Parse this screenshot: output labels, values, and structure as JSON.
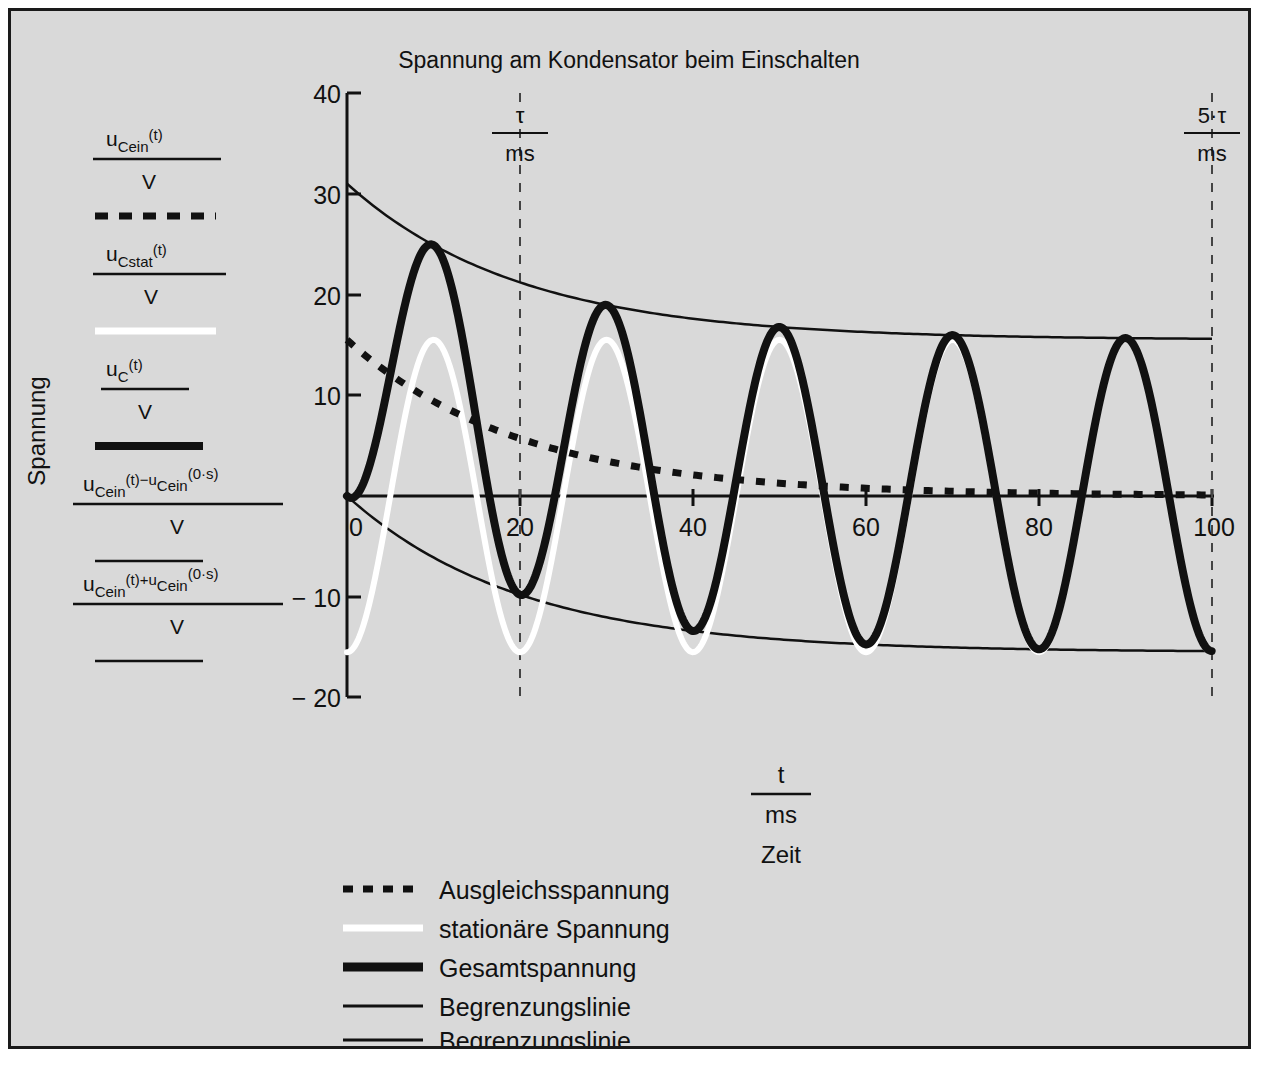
{
  "chart_data": {
    "type": "line",
    "title": "Spannung am Kondensator beim Einschalten",
    "xlabel_fraction": {
      "num": "t",
      "den": "ms"
    },
    "xlabel_text": "Zeit",
    "ylabel_text": "Spannung",
    "xlim": [
      0,
      100
    ],
    "ylim": [
      -20,
      40
    ],
    "xticks": [
      "0",
      "20",
      "40",
      "60",
      "80",
      "100"
    ],
    "xtick_values": [
      0,
      20,
      40,
      60,
      80,
      100
    ],
    "yticks": [
      "40",
      "30",
      "20",
      "10",
      "− 10",
      "− 20"
    ],
    "ytick_values": [
      40,
      30,
      20,
      10,
      -10,
      -20
    ],
    "grid": false,
    "legend_position": "bottom-center",
    "markers": [
      {
        "label_num": "τ",
        "label_den": "ms",
        "x": 20
      },
      {
        "label_num": "5·τ",
        "label_den": "ms",
        "x": 100
      }
    ],
    "parameters": {
      "amplitude_V": 15.5,
      "period_ms": 20,
      "tau_ms": 20,
      "u_initial_V": 15.5,
      "peak_first_V": 25.8,
      "trough_first_V": -9.6,
      "envelope_upper_start_V": 31.0,
      "envelope_lower_start_V": 0.0,
      "envelope_limit_V": 15.5
    },
    "series": [
      {
        "name": "Ausgleichsspannung",
        "style": "dotted",
        "color": "#111111",
        "formula_num": "u_Cein(t)",
        "formula_den": "V",
        "description": "exponential decay 15.5*exp(-t/20)"
      },
      {
        "name": "stationäre Spannung",
        "style": "solid-white",
        "color": "#ffffff",
        "formula_num": "u_Cstat(t)",
        "formula_den": "V",
        "description": "-15.5*cos(2*pi*t/20)"
      },
      {
        "name": "Gesamtspannung",
        "style": "solid-thick",
        "color": "#111111",
        "formula_num": "u_C(t)",
        "formula_den": "V",
        "description": "sum of transient and stationary"
      },
      {
        "name": "Begrenzungslinie",
        "style": "solid-thin",
        "color": "#111111",
        "formula_num": "u_Cein(t)−u_Cein(0·s)",
        "formula_den": "V",
        "description": "lower envelope 15.5*exp(-t/20)-15.5"
      },
      {
        "name": "Begrenzungslinie",
        "style": "solid-thin",
        "color": "#111111",
        "formula_num": "u_Cein(t)+u_Cein(0·s)",
        "formula_den": "V",
        "description": "upper envelope 15.5*exp(-t/20)+15.5"
      }
    ]
  },
  "axis_legend": [
    {
      "num_base": "u",
      "num_sub": "Cein",
      "num_sup": "(t)",
      "den": "V",
      "swatch": "dotted"
    },
    {
      "num_base": "u",
      "num_sub": "Cstat",
      "num_sup": "(t)",
      "den": "V",
      "swatch": "white"
    },
    {
      "num_base": "u",
      "num_sub": "C",
      "num_sup": "(t)",
      "den": "V",
      "swatch": "thick"
    },
    {
      "num_base": "u",
      "num_sub": "Cein",
      "num_sup": "(t)−u",
      "num_sub2": "Cein",
      "num_sup2": "(0·s)",
      "den": "V",
      "swatch": "thin"
    },
    {
      "num_base": "u",
      "num_sub": "Cein",
      "num_sup": "(t)+u",
      "num_sub2": "Cein",
      "num_sup2": "(0·s)",
      "den": "V",
      "swatch": "thin"
    }
  ],
  "bottom_legend": {
    "items": [
      {
        "label": "Ausgleichsspannung",
        "style": "dotted"
      },
      {
        "label": "stationäre Spannung",
        "style": "white"
      },
      {
        "label": "Gesamtspannung",
        "style": "thick"
      },
      {
        "label": "Begrenzungslinie",
        "style": "thin"
      },
      {
        "label": "Begrenzungslinie",
        "style": "thin"
      }
    ]
  },
  "colors": {
    "background": "#d9d9d9",
    "page": "#ffffff",
    "border": "#1a1a1a",
    "ink": "#111111",
    "stationary": "#ffffff"
  }
}
